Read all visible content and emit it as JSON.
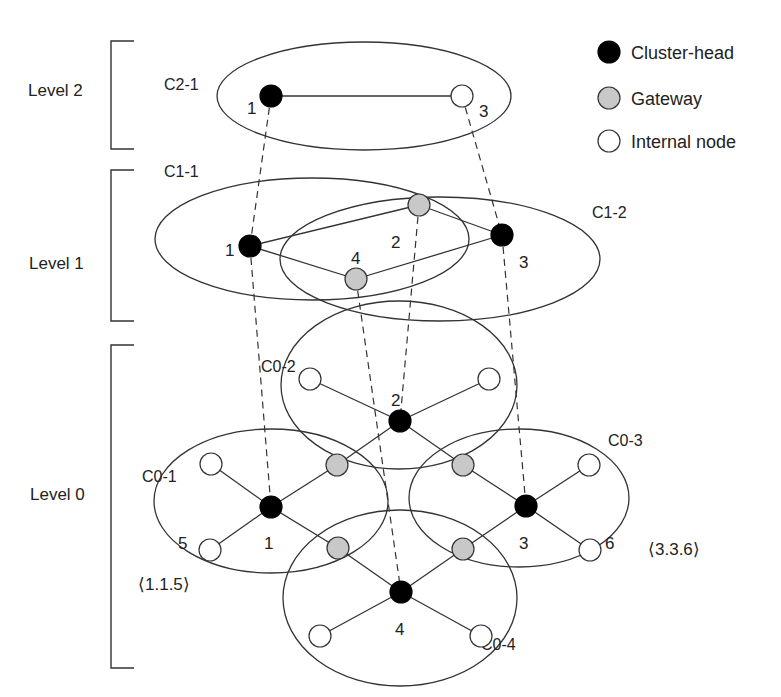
{
  "legend": [
    {
      "type": "cluster-head",
      "label": "Cluster-head",
      "color": "#000000"
    },
    {
      "type": "gateway",
      "label": "Gateway",
      "color": "#c8c8c8"
    },
    {
      "type": "internal",
      "label": "Internal node",
      "color": "#ffffff"
    }
  ],
  "levels": [
    {
      "label": "Level 2"
    },
    {
      "label": "Level 1"
    },
    {
      "label": "Level 0"
    }
  ],
  "clusters": {
    "c2_1": "C2-1",
    "c1_1": "C1-1",
    "c1_2": "C1-2",
    "c0_1": "C0-1",
    "c0_2": "C0-2",
    "c0_3": "C0-3",
    "c0_4": "C0-4"
  },
  "node_labels": {
    "l2_n1": "1",
    "l2_n3": "3",
    "l1_n1": "1",
    "l1_n2": "2",
    "l1_n3": "3",
    "l1_n4": "4",
    "l0_n1": "1",
    "l0_n2": "2",
    "l0_n3": "3",
    "l0_n4": "4",
    "l0_n5": "5",
    "l0_n6": "6"
  },
  "addresses": {
    "a115": "⟨1.1.5⟩",
    "a336": "⟨3.3.6⟩"
  }
}
